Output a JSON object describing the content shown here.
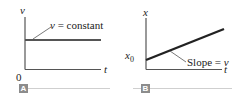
{
  "panels": [
    {
      "id": "A",
      "tag": "A",
      "y_axis_label": "v",
      "x_axis_label": "t",
      "origin_label": "0",
      "annotation": "v = constant",
      "annotation_var": "v",
      "annotation_rest": " = constant"
    },
    {
      "id": "B",
      "tag": "B",
      "y_axis_label": "x",
      "x_axis_label": "t",
      "intercept_label": "x",
      "intercept_sub": "0",
      "annotation": "Slope = v",
      "annotation_text": "Slope = ",
      "annotation_var": "v"
    }
  ],
  "colors": {
    "axis": "#555555",
    "line": "#222222",
    "tag_bg": "#8c8c8c",
    "rule": "#cfcfcf"
  }
}
